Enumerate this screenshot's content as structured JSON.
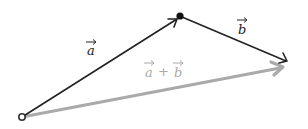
{
  "diagram": {
    "points": {
      "origin": {
        "x": 22,
        "y": 117
      },
      "tip_a": {
        "x": 180,
        "y": 16
      },
      "tip_b": {
        "x": 287,
        "y": 61
      },
      "tip_sum": {
        "x": 284,
        "y": 67
      }
    },
    "vectors": [
      {
        "name": "a",
        "label": "a",
        "color": "#222222"
      },
      {
        "name": "b",
        "label": "b",
        "color": "#222222"
      },
      {
        "name": "sum",
        "label_a": "a",
        "label_plus": "+",
        "label_b": "b",
        "color": "#aaaaaa"
      }
    ],
    "labels": {
      "a": "a",
      "b": "b",
      "sum_a": "a",
      "sum_plus": "+",
      "sum_b": "b"
    }
  }
}
